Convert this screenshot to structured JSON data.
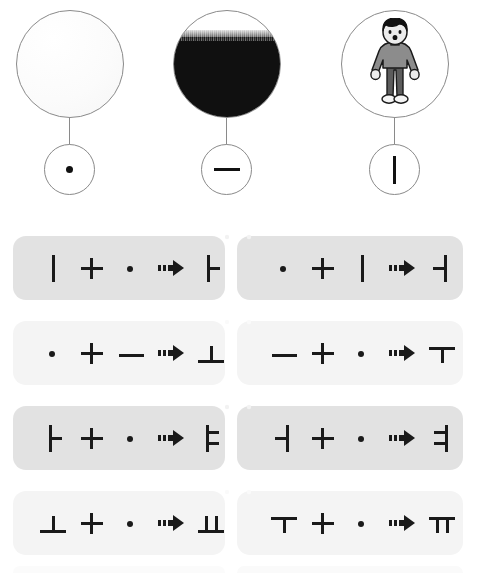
{
  "page": {
    "background_color": "#ffffff"
  },
  "origins": {
    "section_name": "three-origins-of-hangul-vowels",
    "items": [
      {
        "id": "heaven",
        "picture_icon": "sky-circle-icon",
        "picture_description": "white circle representing the sky / heaven",
        "jamo_icon": "dot-jamo-icon",
        "jamo": "ㆍ",
        "jamo_name": "arae-a (dot)",
        "mark_shape": "dot"
      },
      {
        "id": "earth",
        "picture_icon": "earth-circle-icon",
        "picture_description": "dark ground filled circle representing the earth",
        "jamo_icon": "horizontal-bar-jamo-icon",
        "jamo": "ㅡ",
        "jamo_name": "eu (horizontal line)",
        "mark_shape": "horizontal-bar"
      },
      {
        "id": "human",
        "picture_icon": "person-circle-icon",
        "picture_description": "standing child representing the human",
        "jamo_icon": "vertical-bar-jamo-icon",
        "jamo": "ㅣ",
        "jamo_name": "i (vertical line)",
        "mark_shape": "vertical-bar"
      }
    ],
    "person_colors": {
      "hair": "#111111",
      "skin": "#e8e8e8",
      "top": "#8c8c8c",
      "pants": "#5c5c5c",
      "shoes": "#f2f2f2",
      "outline": "#1a1a1a"
    },
    "circle_stroke": "#8a8a8a",
    "sky_fill": "#fdfdfd",
    "earth_fill": "#101010"
  },
  "equations": {
    "section_name": "vowel-combination-equations",
    "operator": "+",
    "arrow_icon": "right-arrow-icon",
    "arrow": "➡",
    "shade_dark": "#e2e2e2",
    "shade_light": "#f4f4f4",
    "rows": [
      {
        "shade": "dark",
        "left": {
          "a": "ㅣ",
          "a_icon": "vertical-bar-jamo-icon",
          "b": "ㆍ",
          "b_icon": "dot-jamo-icon",
          "result": "ㅏ",
          "result_icon": "a-jamo-icon"
        },
        "right": {
          "a": "ㆍ",
          "a_icon": "dot-jamo-icon",
          "b": "ㅣ",
          "b_icon": "vertical-bar-jamo-icon",
          "result": "ㅓ",
          "result_icon": "eo-jamo-icon"
        }
      },
      {
        "shade": "light",
        "left": {
          "a": "ㆍ",
          "a_icon": "dot-jamo-icon",
          "b": "ㅡ",
          "b_icon": "horizontal-bar-jamo-icon",
          "result": "ㅗ",
          "result_icon": "o-jamo-icon"
        },
        "right": {
          "a": "ㅡ",
          "a_icon": "horizontal-bar-jamo-icon",
          "b": "ㆍ",
          "b_icon": "dot-jamo-icon",
          "result": "ㅜ",
          "result_icon": "u-jamo-icon"
        }
      },
      {
        "shade": "dark",
        "left": {
          "a": "ㅏ",
          "a_icon": "a-jamo-icon",
          "b": "ㆍ",
          "b_icon": "dot-jamo-icon",
          "result": "ㅑ",
          "result_icon": "ya-jamo-icon"
        },
        "right": {
          "a": "ㅓ",
          "a_icon": "eo-jamo-icon",
          "b": "ㆍ",
          "b_icon": "dot-jamo-icon",
          "result": "ㅕ",
          "result_icon": "yeo-jamo-icon"
        }
      },
      {
        "shade": "light",
        "left": {
          "a": "ㅗ",
          "a_icon": "o-jamo-icon",
          "b": "ㆍ",
          "b_icon": "dot-jamo-icon",
          "result": "ㅛ",
          "result_icon": "yo-jamo-icon"
        },
        "right": {
          "a": "ㅜ",
          "a_icon": "u-jamo-icon",
          "b": "ㆍ",
          "b_icon": "dot-jamo-icon",
          "result": "ㅠ",
          "result_icon": "yu-jamo-icon"
        }
      }
    ]
  }
}
